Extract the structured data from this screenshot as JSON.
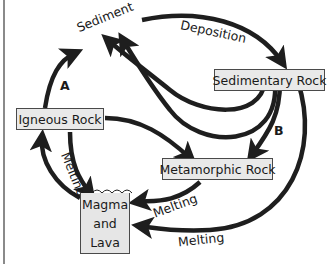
{
  "diagram": {
    "nodes": {
      "sediment": "Sediment",
      "sedimentary_rock": "Sedimentary Rock",
      "igneous_rock": "Igneous Rock",
      "metamorphic_rock": "Metamorphic Rock",
      "magma_line1": "Magma",
      "magma_line2": "and",
      "magma_line3": "Lava"
    },
    "edge_labels": {
      "deposition": "Deposition",
      "melting_igneous": "Melting",
      "melting_metamorphic": "Melting",
      "melting_sedimentary": "Melting",
      "a": "A",
      "b": "B"
    },
    "colors": {
      "arrow": "#1e1e1e",
      "box_fill": "#e9e9e9",
      "box_border": "#4a4a4a"
    }
  }
}
